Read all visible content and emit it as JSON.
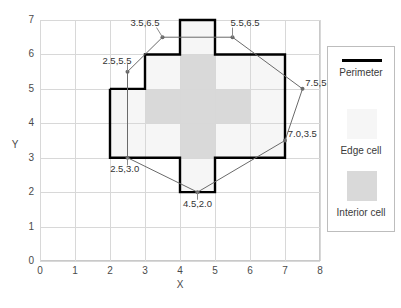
{
  "chart_data": {
    "type": "scatter",
    "title": "",
    "xlabel": "X",
    "ylabel": "Y",
    "xlim": [
      0,
      8
    ],
    "ylim": [
      0,
      7
    ],
    "xticks": [
      "0",
      "1",
      "2",
      "3",
      "4",
      "5",
      "6",
      "7",
      "8"
    ],
    "yticks": [
      "0",
      "1",
      "2",
      "3",
      "4",
      "5",
      "6",
      "7"
    ],
    "grid": true,
    "legend_position": "right-outside",
    "legend": [
      {
        "label": "Perimeter",
        "marker": "line",
        "color": "#000000"
      },
      {
        "label": "Edge cell",
        "marker": "square",
        "color": "#f6f6f6"
      },
      {
        "label": "Interior cell",
        "marker": "square",
        "color": "#d9d9d9"
      }
    ],
    "annotations": [
      {
        "text": "2.5,5.5",
        "x": 2.5,
        "y": 5.5
      },
      {
        "text": "3.5,6.5",
        "x": 3.5,
        "y": 6.5
      },
      {
        "text": "5.5,6.5",
        "x": 5.5,
        "y": 6.5
      },
      {
        "text": "7.5,5.0",
        "x": 7.5,
        "y": 5.0
      },
      {
        "text": "7.0,3.5",
        "x": 7.0,
        "y": 3.5
      },
      {
        "text": "4.5,2.0",
        "x": 4.5,
        "y": 2.0
      },
      {
        "text": "2.5,3.0",
        "x": 2.5,
        "y": 3.0
      }
    ],
    "polygon_points": [
      {
        "x": 2.5,
        "y": 5.5
      },
      {
        "x": 3.5,
        "y": 6.5
      },
      {
        "x": 5.5,
        "y": 6.5
      },
      {
        "x": 7.5,
        "y": 5.0
      },
      {
        "x": 7.0,
        "y": 3.5
      },
      {
        "x": 4.5,
        "y": 2.0
      },
      {
        "x": 2.5,
        "y": 3.0
      }
    ],
    "perimeter_path": [
      {
        "x": 2,
        "y": 5
      },
      {
        "x": 3,
        "y": 5
      },
      {
        "x": 3,
        "y": 6
      },
      {
        "x": 4,
        "y": 6
      },
      {
        "x": 4,
        "y": 7
      },
      {
        "x": 5,
        "y": 7
      },
      {
        "x": 5,
        "y": 6
      },
      {
        "x": 7,
        "y": 6
      },
      {
        "x": 7,
        "y": 3
      },
      {
        "x": 5,
        "y": 3
      },
      {
        "x": 5,
        "y": 2
      },
      {
        "x": 4,
        "y": 2
      },
      {
        "x": 4,
        "y": 3
      },
      {
        "x": 2,
        "y": 3
      },
      {
        "x": 2,
        "y": 5
      }
    ],
    "edge_cells": [
      {
        "x": 2,
        "y": 4
      },
      {
        "x": 2,
        "y": 3
      },
      {
        "x": 3,
        "y": 5
      },
      {
        "x": 3,
        "y": 3
      },
      {
        "x": 4,
        "y": 6
      },
      {
        "x": 4,
        "y": 2
      },
      {
        "x": 5,
        "y": 5
      },
      {
        "x": 5,
        "y": 3
      },
      {
        "x": 6,
        "y": 5
      },
      {
        "x": 6,
        "y": 3
      },
      {
        "x": 3,
        "y": 4
      },
      {
        "x": 6,
        "y": 4
      },
      {
        "x": 4,
        "y": 3
      },
      {
        "x": 4,
        "y": 5
      }
    ],
    "interior_cells": [
      {
        "x": 4,
        "y": 5
      },
      {
        "x": 4,
        "y": 4
      },
      {
        "x": 4,
        "y": 3
      },
      {
        "x": 3,
        "y": 4
      },
      {
        "x": 5,
        "y": 4
      }
    ]
  }
}
